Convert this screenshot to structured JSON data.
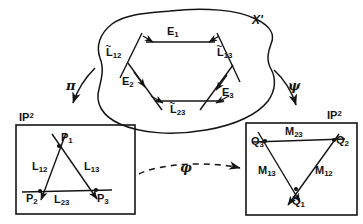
{
  "figure": {
    "title_label": "X'",
    "space_left_label": "IP",
    "space_left_exponent": "2",
    "space_right_label": "IP",
    "space_right_exponent": "2",
    "maps": [
      {
        "name": "pi-map",
        "symbol": "π",
        "from": "X'",
        "to": "IP2-left"
      },
      {
        "name": "psi-map",
        "symbol": "ψ",
        "from": "X'",
        "to": "IP2-right"
      },
      {
        "name": "phi-map",
        "symbol": "φ",
        "from": "IP2-left",
        "to": "IP2-right",
        "style": "dashed"
      }
    ],
    "blob": {
      "name": "X-prime-region",
      "hexagon_edges": [
        {
          "label": "E",
          "sub": "1",
          "position": "top"
        },
        {
          "label": "E",
          "sub": "2",
          "position": "lower-left"
        },
        {
          "label": "E",
          "sub": "3",
          "position": "lower-right"
        }
      ],
      "hexagon_lines": [
        {
          "label": "L",
          "sub": "12",
          "tilde": true,
          "position": "upper-left"
        },
        {
          "label": "L",
          "sub": "13",
          "tilde": true,
          "position": "upper-right"
        },
        {
          "label": "L",
          "sub": "23",
          "tilde": true,
          "position": "bottom"
        }
      ]
    },
    "left_plane": {
      "name": "left-projective-plane",
      "points": [
        {
          "label": "P",
          "sub": "1"
        },
        {
          "label": "P",
          "sub": "2"
        },
        {
          "label": "P",
          "sub": "3"
        }
      ],
      "lines": [
        {
          "label": "L",
          "sub": "12"
        },
        {
          "label": "L",
          "sub": "13"
        },
        {
          "label": "L",
          "sub": "23"
        }
      ]
    },
    "right_plane": {
      "name": "right-projective-plane",
      "points": [
        {
          "label": "Q",
          "sub": "1"
        },
        {
          "label": "Q",
          "sub": "2"
        },
        {
          "label": "Q",
          "sub": "3"
        }
      ],
      "lines": [
        {
          "label": "M",
          "sub": "12"
        },
        {
          "label": "M",
          "sub": "13"
        },
        {
          "label": "M",
          "sub": "23"
        }
      ]
    },
    "colors": {
      "ink": "#141414",
      "background": "#ffffff"
    }
  }
}
